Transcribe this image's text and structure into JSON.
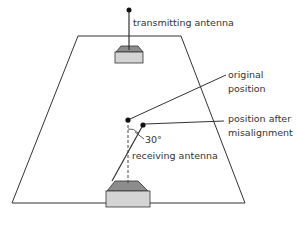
{
  "diagram": {
    "labels": {
      "transmitting_antenna": "transmitting antenna",
      "original_position_line1": "original",
      "original_position_line2": "position",
      "misaligned_line1": "position after",
      "misaligned_line2": "misalignment",
      "angle": "30°",
      "receiving_antenna": "receiving antenna"
    },
    "colors": {
      "stroke": "#333333",
      "plane_fill": "#ffffff",
      "box_top": "#8c8c8c",
      "box_body": "#d4d4d4"
    }
  }
}
